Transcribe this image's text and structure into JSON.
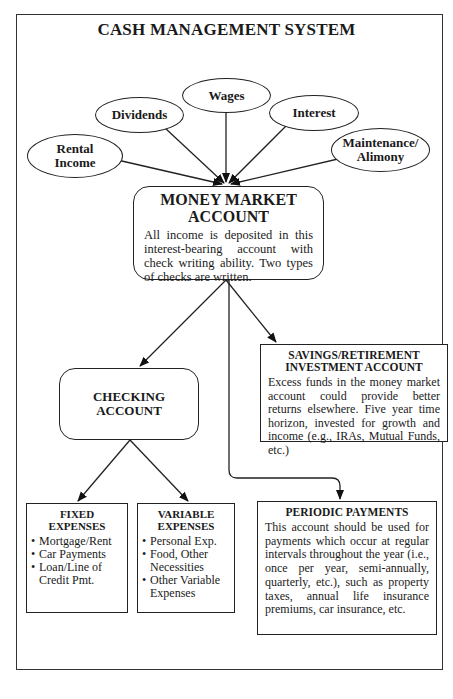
{
  "diagram": {
    "title": "CASH MANAGEMENT SYSTEM",
    "income_sources": [
      {
        "label": "Rental Income"
      },
      {
        "label": "Dividends"
      },
      {
        "label": "Wages"
      },
      {
        "label": "Interest"
      },
      {
        "label": "Maintenance/ Alimony"
      }
    ],
    "money_market": {
      "title": "MONEY MARKET ACCOUNT",
      "text": "All income is deposited in this interest-bearing account with check writing ability. Two types of checks are written."
    },
    "checking": {
      "title": "CHECKING ACCOUNT"
    },
    "savings": {
      "title": "SAVINGS/RETIREMENT INVESTMENT ACCOUNT",
      "text": "Excess funds in the money market account could provide better returns elsewhere. Five year time horizon, invested for growth and income (e.g., IRAs, Mutual Funds, etc.)"
    },
    "fixed_expenses": {
      "title": "FIXED EXPENSES",
      "items": [
        "Mortgage/Rent",
        "Car Payments",
        "Loan/Line of Credit Pmt."
      ]
    },
    "variable_expenses": {
      "title": "VARIABLE EXPENSES",
      "items": [
        "Personal Exp.",
        "Food, Other Necessities",
        "Other Variable Expenses"
      ]
    },
    "periodic_payments": {
      "title": "PERIODIC PAYMENTS",
      "text": "This account should be used for payments which occur at regular intervals throughout the year (i.e., once per year, semi-annually, quarterly, etc.), such as property taxes, annual life insurance premiums, car insurance, etc."
    }
  }
}
